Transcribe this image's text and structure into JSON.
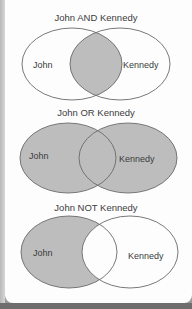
{
  "colors": {
    "fill": "#bdbdbd",
    "stroke": "#6a6a6a",
    "background": "#fdfdfd",
    "text": "#3c3c3c"
  },
  "diagrams": [
    {
      "title": "John AND Kennedy",
      "left_label": "John",
      "right_label": "Kennedy",
      "shaded": "intersection"
    },
    {
      "title": "John OR Kennedy",
      "left_label": "John",
      "right_label": "Kennedy",
      "shaded": "union"
    },
    {
      "title": "John NOT Kennedy",
      "left_label": "John",
      "right_label": "Kennedy",
      "shaded": "left-only"
    }
  ]
}
